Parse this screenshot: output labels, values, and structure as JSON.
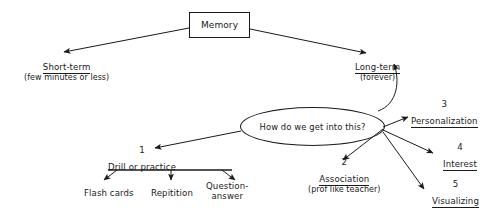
{
  "diagram": {
    "title": "Memory",
    "root": {
      "label": "Memory",
      "shape": "box"
    },
    "branches": {
      "short_term": {
        "label": "Short-term",
        "detail": "(few minutes or less)"
      },
      "long_term": {
        "label": "Long-term",
        "detail": "(forever)"
      }
    },
    "question": {
      "label": "How do we get into this?",
      "shape": "ellipse"
    },
    "methods": [
      {
        "number": "1",
        "label": "Drill or practice",
        "children": [
          {
            "label": "Flash cards"
          },
          {
            "label": "Repitition"
          },
          {
            "label": "Question-",
            "label2": "answer"
          }
        ]
      },
      {
        "number": "2",
        "label": "Association",
        "detail": "(prof like teacher)"
      },
      {
        "number": "3",
        "label": "Personalization"
      },
      {
        "number": "4",
        "label": "Interest"
      },
      {
        "number": "5",
        "label": "Visualizing"
      }
    ],
    "colors": {
      "background": "#ffffff",
      "ink": "#1a1a1a"
    }
  }
}
